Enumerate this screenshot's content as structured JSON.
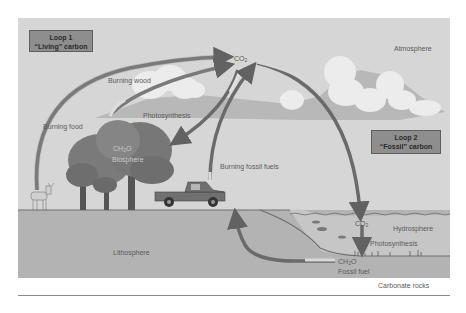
{
  "diagram": {
    "colors": {
      "panel_sky": "#d6d6d6",
      "panel_ground": "#b4b4b4",
      "water": "#c4c4c4",
      "clouds": "#e8e8e8",
      "arrow_dark": "#6a6a6a",
      "arrow_light": "#cfcfcf",
      "loop_box": "#8e8e8e",
      "tree": "#7a7a7a"
    },
    "loops": [
      {
        "id": "loop1",
        "title": "Loop 1",
        "subtitle": "“Living” carbon"
      },
      {
        "id": "loop2",
        "title": "Loop 2",
        "subtitle": "“Fossil” carbon"
      }
    ],
    "spheres": {
      "atmosphere": "Atmosphere",
      "biosphere": "Biosphere",
      "hydrosphere": "Hydrosphere",
      "lithosphere": "Lithosphere",
      "carbonate_rocks": "Carbonate rocks"
    },
    "compounds": {
      "co2_atmosphere": {
        "base": "CO",
        "sub": "2"
      },
      "ch2o_biosphere": {
        "base": "CH",
        "sub": "2",
        "tail": "O"
      },
      "co2_ocean": {
        "base": "CO",
        "sub": "2"
      },
      "ch2o_fossil": {
        "base": "CH",
        "sub": "2",
        "tail": "O"
      }
    },
    "processes": {
      "burning_wood": "Burning wood",
      "burning_food": "Burning food",
      "photosynthesis_land": "Photosynthesis",
      "burning_fossil_fuels": "Burning fossil fuels",
      "photosynthesis_ocean": "Photosynthesis",
      "fossil_fuel": "Fossil fuel"
    },
    "icons": [
      "deer-icon",
      "tree-icon",
      "pickup-truck-icon",
      "fish-icon",
      "cloud-icon",
      "seaweed-icon"
    ]
  }
}
